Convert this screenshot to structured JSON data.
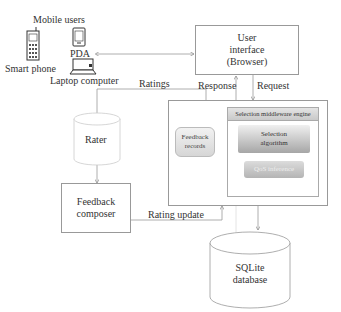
{
  "diagram": {
    "mobile_users": {
      "title": "Mobile users",
      "devices": [
        {
          "label": "Smart phone",
          "icon": "smartphone-icon"
        },
        {
          "label": "PDA",
          "icon": "pda-icon"
        },
        {
          "label": "Laptop computer",
          "icon": "laptop-icon"
        }
      ]
    },
    "user_interface": {
      "line1": "User",
      "line2": "interface",
      "line3": "(Browser)"
    },
    "rater": {
      "label": "Rater"
    },
    "feedback_composer": {
      "line1": "Feedback",
      "line2": "composer"
    },
    "server": {
      "feedback_records": {
        "line1": "Feedback",
        "line2": "records"
      },
      "selection_engine": {
        "title": "Selection middleware engine",
        "algorithm": {
          "line1": "Selection",
          "line2": "algorithm"
        },
        "sub_module": "QoS inference"
      }
    },
    "database": {
      "line1": "SQLite",
      "line2": "database"
    },
    "edges": {
      "ratings": "Ratings",
      "response": "Response",
      "request": "Request",
      "rating_update": "Rating update"
    }
  }
}
